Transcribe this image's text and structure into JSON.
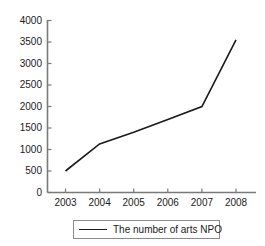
{
  "chart_data": {
    "type": "line",
    "title": "",
    "subtitle": "",
    "xlabel": "",
    "ylabel": "",
    "categories": [
      "2003",
      "2004",
      "2005",
      "2006",
      "2007",
      "2008"
    ],
    "x": [
      2003,
      2004,
      2005,
      2006,
      2007,
      2008
    ],
    "series": [
      {
        "name": "The number of arts NPO",
        "values": [
          500,
          1130,
          1400,
          1700,
          2000,
          3550
        ],
        "color": "#1a1a1a"
      }
    ],
    "values": [
      500,
      1130,
      1400,
      1700,
      2000,
      3550
    ],
    "ylim": [
      0,
      4000
    ],
    "xlim": [
      2003,
      2008
    ],
    "yticks": [
      0,
      500,
      1000,
      1500,
      2000,
      2500,
      3000,
      3500,
      4000
    ],
    "ytick_labels": [
      "0",
      "500",
      "1000",
      "1500",
      "2000",
      "2500",
      "3000",
      "3500",
      "4000"
    ],
    "xtick_labels": [
      "2003",
      "2004",
      "2005",
      "2006",
      "2007",
      "2008"
    ],
    "grid": false,
    "legend_position": "bottom",
    "legend_entries": [
      "The number of arts NPO"
    ],
    "annotations": []
  },
  "legend": {
    "label": "The number of arts NPO"
  },
  "colors": {
    "line": "#1a1a1a",
    "axis": "#7a7a7a",
    "legend_border": "#8a8a8a",
    "text": "#1a1a1a",
    "background": "#ffffff"
  }
}
